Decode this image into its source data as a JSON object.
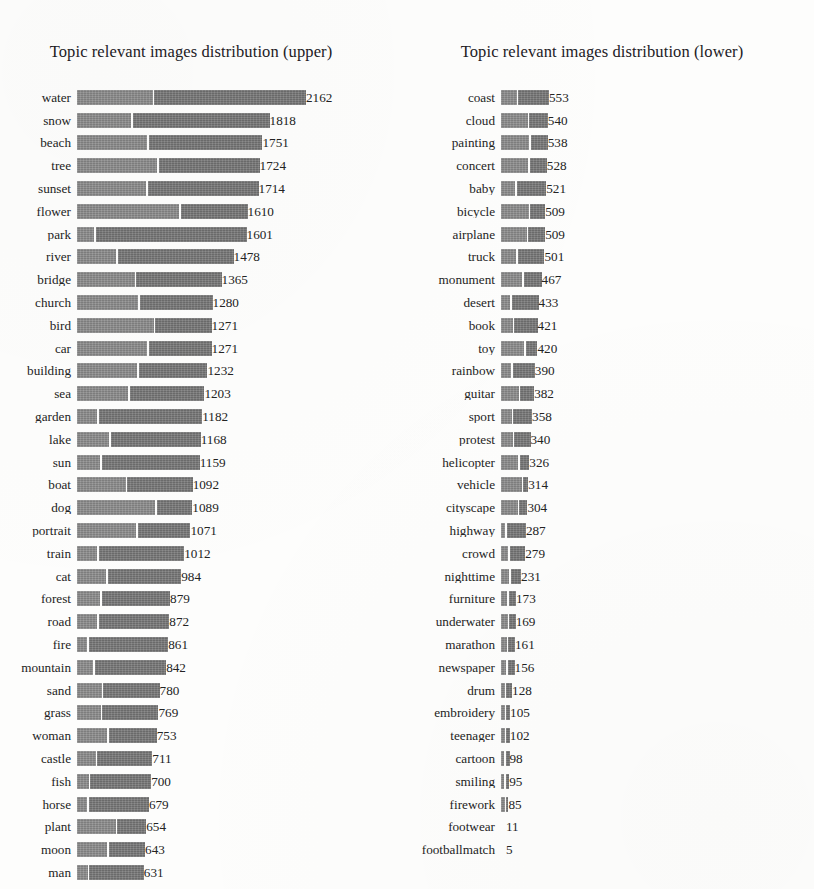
{
  "figure": {
    "background": "#fdfdfc",
    "bar_color": "#7e7e7e",
    "text_color": "#232323"
  },
  "chart_data": [
    {
      "type": "bar",
      "orientation": "horizontal",
      "title": "Topic relevant images distribution (upper)",
      "xlabel": "",
      "ylabel": "",
      "grid": false,
      "legend": "none",
      "stacked": true,
      "xlim": [
        0,
        2162
      ],
      "value_labels": true,
      "sorted": "descending",
      "categories": [
        "water",
        "snow",
        "beach",
        "tree",
        "sunset",
        "flower",
        "park",
        "river",
        "bridge",
        "church",
        "bird",
        "car",
        "building",
        "sea",
        "garden",
        "lake",
        "sun",
        "boat",
        "dog",
        "portrait",
        "train",
        "cat",
        "forest",
        "road",
        "fire",
        "mountain",
        "sand",
        "grass",
        "woman",
        "castle",
        "fish",
        "horse",
        "plant",
        "moon",
        "man"
      ],
      "values": [
        2162,
        1818,
        1751,
        1724,
        1714,
        1610,
        1601,
        1478,
        1365,
        1280,
        1271,
        1271,
        1232,
        1203,
        1182,
        1168,
        1159,
        1092,
        1089,
        1071,
        1012,
        984,
        879,
        872,
        861,
        842,
        780,
        769,
        753,
        711,
        700,
        679,
        654,
        643,
        631
      ],
      "segment_fraction": [
        0.33,
        0.28,
        0.38,
        0.44,
        0.38,
        0.6,
        0.1,
        0.25,
        0.4,
        0.45,
        0.57,
        0.52,
        0.46,
        0.4,
        0.16,
        0.26,
        0.19,
        0.42,
        0.68,
        0.52,
        0.19,
        0.28,
        0.25,
        0.22,
        0.11,
        0.18,
        0.3,
        0.29,
        0.38,
        0.25,
        0.16,
        0.14,
        0.56,
        0.44,
        0.16
      ]
    },
    {
      "type": "bar",
      "orientation": "horizontal",
      "title": "Topic relevant images distribution (lower)",
      "xlabel": "",
      "ylabel": "",
      "grid": false,
      "legend": "none",
      "stacked": true,
      "xlim": [
        0,
        553
      ],
      "value_labels": true,
      "sorted": "descending",
      "categories": [
        "coast",
        "cloud",
        "painting",
        "concert",
        "baby",
        "bicycle",
        "airplane",
        "truck",
        "monument",
        "desert",
        "book",
        "toy",
        "rainbow",
        "guitar",
        "sport",
        "protest",
        "helicopter",
        "vehicle",
        "cityscape",
        "highway",
        "crowd",
        "nighttime",
        "furniture",
        "underwater",
        "marathon",
        "newspaper",
        "drum",
        "embroidery",
        "teenager",
        "cartoon",
        "smiling",
        "firework",
        "footwear",
        "footballmatch"
      ],
      "values": [
        553,
        540,
        538,
        528,
        521,
        509,
        509,
        501,
        467,
        433,
        421,
        420,
        390,
        382,
        358,
        340,
        326,
        314,
        304,
        287,
        279,
        231,
        173,
        169,
        161,
        156,
        128,
        105,
        102,
        98,
        95,
        85,
        11,
        5
      ],
      "segment_fraction": [
        0.33,
        0.57,
        0.6,
        0.59,
        0.32,
        0.63,
        0.58,
        0.35,
        0.52,
        0.25,
        0.32,
        0.63,
        0.3,
        0.54,
        0.35,
        0.4,
        0.61,
        0.76,
        0.63,
        0.18,
        0.3,
        0.4,
        0.4,
        0.46,
        0.4,
        0.38,
        0.33,
        0.4,
        0.4,
        0.35,
        0.38,
        0.5,
        0.0,
        0.0
      ]
    }
  ]
}
